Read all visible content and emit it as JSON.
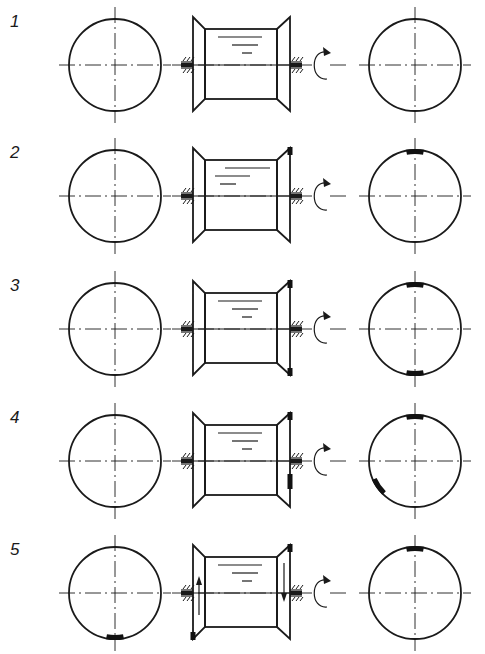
{
  "figure": {
    "ink_color": "#1a1a1a",
    "background_color": "#ffffff"
  },
  "rows": [
    {
      "label": "1",
      "drum_level_lines": 3,
      "drum_marks": [],
      "flange_arrows": "none",
      "left_weights_deg": [],
      "right_weights_deg": []
    },
    {
      "label": "2",
      "drum_level_lines": 3,
      "drum_marks": [
        "right-top"
      ],
      "flange_arrows": "none",
      "left_weights_deg": [],
      "right_weights_deg": [
        90
      ]
    },
    {
      "label": "3",
      "drum_level_lines": 3,
      "drum_marks": [
        "right-top",
        "right-bottom"
      ],
      "flange_arrows": "none",
      "left_weights_deg": [],
      "right_weights_deg": [
        90,
        270
      ]
    },
    {
      "label": "4",
      "drum_level_lines": 3,
      "drum_marks": [
        "right-top",
        "right-lower-side"
      ],
      "flange_arrows": "none",
      "left_weights_deg": [],
      "right_weights_deg": [
        90,
        215
      ]
    },
    {
      "label": "5",
      "drum_level_lines": 3,
      "drum_marks": [
        "right-top",
        "left-bottom"
      ],
      "flange_arrows": "left-up-right-down",
      "left_weights_deg": [
        270
      ],
      "right_weights_deg": [
        90
      ]
    }
  ],
  "icons": {
    "rotation": "rotation-arrow-icon",
    "bearing": "bearing-hatch-icon",
    "balance_weight": "balance-weight-icon"
  }
}
